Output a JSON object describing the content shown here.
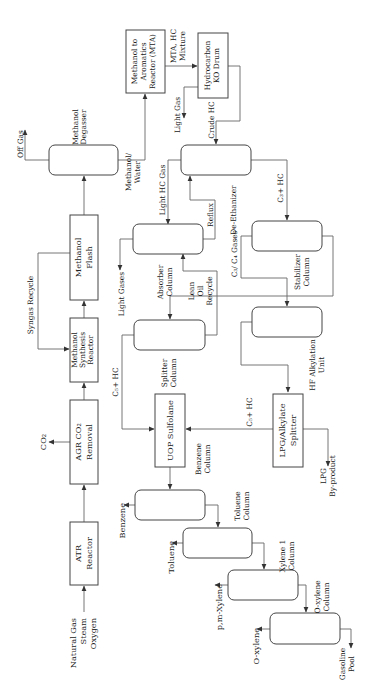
{
  "orientation": "rotated 90 degrees counter-clockwise",
  "colors": {
    "line": "#666666",
    "box_stroke": "#444444",
    "text": "#222222",
    "background": "#ffffff"
  },
  "units": {
    "atr": {
      "line1": "ATR",
      "line2": "Reactor"
    },
    "agr": {
      "line1": "AGR CO₂",
      "line2": "Removal"
    },
    "mesr": {
      "line1": "Methanol",
      "line2": "Synthesis",
      "line3": "Reactor"
    },
    "flash": {
      "line1": "Methanol",
      "line2": "Flash"
    },
    "degasser": {
      "line1": "Methanol",
      "line2": "Degasser"
    },
    "mta": {
      "line1": "Methanol to",
      "line2": "Aromatics",
      "line3": "Reactor (MTA)"
    },
    "ko_drum": {
      "line1": "Hydrocarbon",
      "line2": "KO Drum"
    },
    "deethanizer": {
      "line1": "De-Ethanizer"
    },
    "absorber": {
      "line1": "Absorber",
      "line2": "Column"
    },
    "stabilizer": {
      "line1": "Stabilizer",
      "line2": "Column"
    },
    "splitter": {
      "line1": "Splitter",
      "line2": "Column"
    },
    "hf_alky": {
      "line1": "HF Alkylation",
      "line2": "Unit"
    },
    "sulfolane": {
      "line1": "UOP Sulfolane"
    },
    "lpg_splitter": {
      "line1": "LPG/Alkylate",
      "line2": "Splitter"
    },
    "benzene_col": {
      "line1": "Benzene",
      "line2": "Column"
    },
    "toluene_col": {
      "line1": "Toluene",
      "line2": "Column"
    },
    "xylene1_col": {
      "line1": "Xylene 1",
      "line2": "Column"
    },
    "oxylene_col": {
      "line1": "O-xylene",
      "line2": "Column"
    }
  },
  "streams": {
    "feed": {
      "line1": "Natural Gas",
      "line2": "Steam",
      "line3": "Oxygen"
    },
    "co2": "CO₂",
    "syngas_recycle": "Syngas Recycle",
    "off_gas": "Off Gas",
    "methanol_water": {
      "line1": "Methanol/",
      "line2": "Water"
    },
    "mta_hc_mixture": {
      "line1": "MTA, HC",
      "line2": "Mixture"
    },
    "light_gas": "Light Gas",
    "crude_hc": "Crude HC",
    "light_hc_gas": "Light HC Gas",
    "reflux": "Reflux",
    "c3_hc": "C₃+ HC",
    "light_gases": "Light Gases",
    "lean_oil_recycle": {
      "line1": "Lean",
      "line2": "Oil",
      "line3": "Recycle"
    },
    "c3_c4_gases": "C₃/ C₄ Gases",
    "c5_hc_left": "C₅+ HC",
    "c5_hc_right": "C₅+ HC",
    "lpg_byproduct": {
      "line1": "LPG",
      "line2": "By-product"
    },
    "benzene": "Benzene",
    "toluene": "Toluene",
    "pm_xylene": "p,m-Xylene",
    "o_xylene": "O-xylene",
    "gasoline_pool": {
      "line1": "Gasoline",
      "line2": "Pool"
    }
  }
}
